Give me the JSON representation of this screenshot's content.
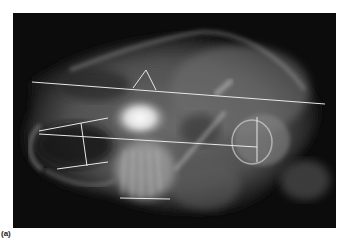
{
  "figure": {
    "caption": "(a)",
    "line_color": "#e8e8e8",
    "background_color": "#0c0c0c"
  }
}
